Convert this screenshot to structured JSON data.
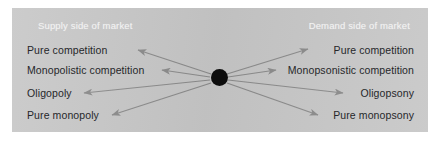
{
  "figure": {
    "panel_color": "#c8c8c8",
    "page_color": "#ffffff",
    "arrow_color": "#8c8c8c",
    "hub_color": "#0d0d0d",
    "label_color": "#26272a",
    "heading_color": "#f2f2f2"
  },
  "headings": {
    "supply": "Supply side of market",
    "demand": "Demand side of market"
  },
  "supply_labels": [
    "Pure competition",
    "Monopolistic competition",
    "Oligopoly",
    "Pure monopoly"
  ],
  "demand_labels": [
    "Pure competition",
    "Monopsonistic competition",
    "Oligopsony",
    "Pure monopsony"
  ],
  "hub": {
    "label": "market-center-node",
    "cx": 207,
    "cy": 69,
    "r": 8.5
  },
  "arrows": [
    {
      "name": "arrow-supply-pure-competition",
      "x1": 199,
      "y1": 66,
      "x2": 126,
      "y2": 42
    },
    {
      "name": "arrow-supply-monopolistic-competition",
      "x1": 198,
      "y1": 69,
      "x2": 150,
      "y2": 62
    },
    {
      "name": "arrow-supply-oligopoly",
      "x1": 198,
      "y1": 72,
      "x2": 72,
      "y2": 85
    },
    {
      "name": "arrow-supply-pure-monopoly",
      "x1": 199,
      "y1": 75,
      "x2": 100,
      "y2": 107
    },
    {
      "name": "arrow-demand-pure-competition",
      "x1": 215,
      "y1": 66,
      "x2": 296,
      "y2": 41
    },
    {
      "name": "arrow-demand-monopsonistic-competition",
      "x1": 216,
      "y1": 69,
      "x2": 264,
      "y2": 62
    },
    {
      "name": "arrow-demand-oligopsony",
      "x1": 216,
      "y1": 72,
      "x2": 331,
      "y2": 85
    },
    {
      "name": "arrow-demand-pure-monopsony",
      "x1": 215,
      "y1": 75,
      "x2": 306,
      "y2": 107
    }
  ]
}
